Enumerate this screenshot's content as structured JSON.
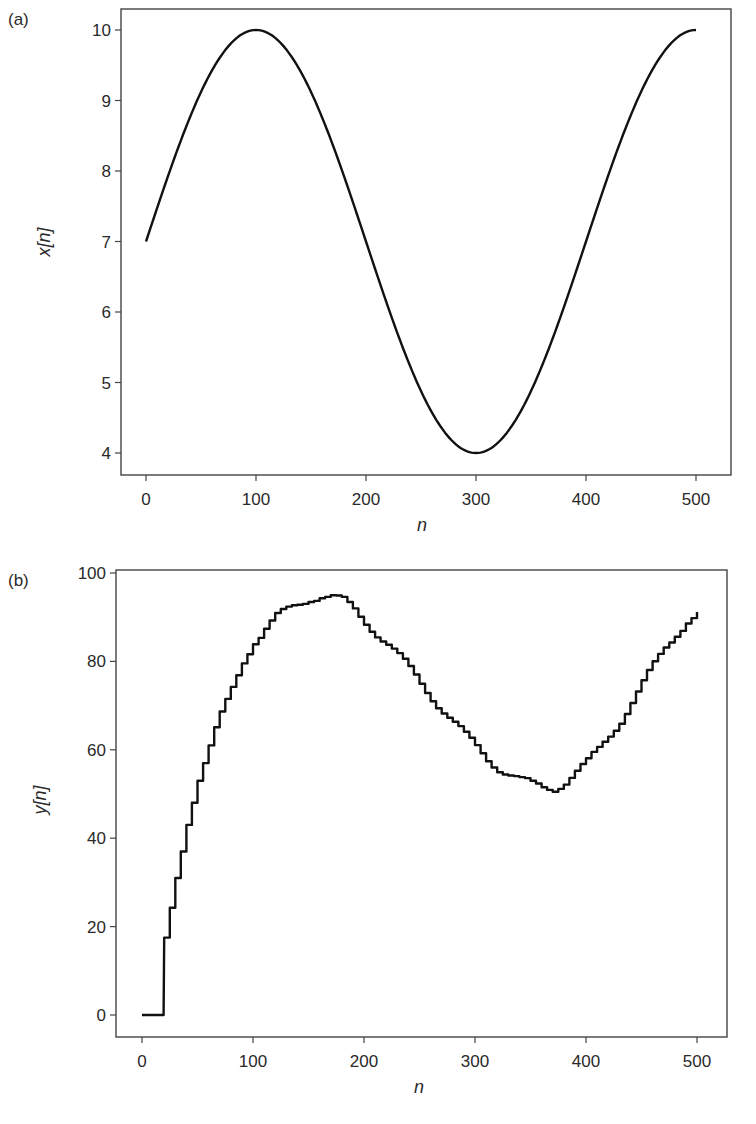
{
  "chart_data": [
    {
      "type": "line",
      "panel_label": "(a)",
      "title": "",
      "xlabel": "n",
      "ylabel": "x[n]",
      "xlim": [
        -20,
        520
      ],
      "ylim": [
        3.7,
        10.3
      ],
      "xticks": [
        0,
        100,
        200,
        300,
        400,
        500
      ],
      "yticks": [
        4,
        5,
        6,
        7,
        8,
        9,
        10
      ],
      "grid": false,
      "legend": null,
      "series": [
        {
          "name": "x[n]",
          "formula": "7 + 3*sin(2*pi*n/400)",
          "x": [
            0,
            25,
            50,
            75,
            100,
            125,
            150,
            175,
            200,
            225,
            250,
            275,
            300,
            325,
            350,
            375,
            400,
            425,
            450,
            475,
            500
          ],
          "values": [
            7.0,
            8.15,
            9.12,
            9.77,
            10.0,
            9.77,
            9.12,
            8.15,
            7.0,
            5.85,
            4.88,
            4.23,
            4.0,
            4.23,
            4.88,
            5.85,
            7.0,
            8.15,
            9.12,
            9.77,
            10.0
          ]
        }
      ]
    },
    {
      "type": "line",
      "panel_label": "(b)",
      "title": "",
      "xlabel": "n",
      "ylabel": "y[n]",
      "xlim": [
        -12,
        525
      ],
      "ylim": [
        -5,
        101
      ],
      "xticks": [
        0,
        100,
        200,
        300,
        400,
        500
      ],
      "yticks": [
        0,
        20,
        40,
        60,
        80,
        100
      ],
      "grid": false,
      "legend": null,
      "series": [
        {
          "name": "y[n]",
          "style": "staircase with small ripple",
          "x": [
            0,
            10,
            19,
            20,
            30,
            40,
            50,
            60,
            70,
            80,
            90,
            100,
            110,
            120,
            130,
            140,
            150,
            160,
            170,
            180,
            190,
            200,
            210,
            220,
            230,
            240,
            250,
            260,
            270,
            280,
            290,
            300,
            310,
            320,
            330,
            340,
            350,
            360,
            370,
            380,
            390,
            400,
            410,
            420,
            430,
            440,
            450,
            460,
            470,
            480,
            490,
            500
          ],
          "values": [
            0,
            0,
            0,
            17.5,
            31,
            43,
            53,
            61,
            68,
            74,
            80,
            84.5,
            87.5,
            90,
            91.5,
            93,
            94.5,
            95,
            94.5,
            93.5,
            91.5,
            89,
            86.5,
            84,
            81,
            78,
            75,
            72,
            69,
            66,
            63,
            60.5,
            58,
            56,
            54.5,
            53,
            52,
            51.5,
            51.5,
            53,
            55,
            57,
            60,
            63.5,
            67,
            71,
            75,
            79,
            83,
            86.5,
            89.5,
            91
          ]
        }
      ]
    }
  ]
}
